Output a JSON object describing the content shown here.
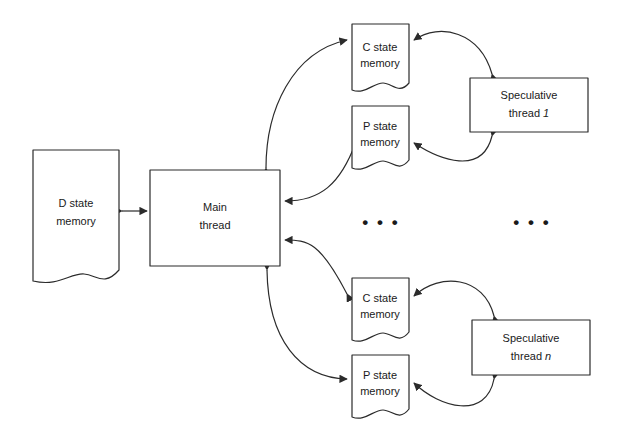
{
  "figure": {
    "type": "block-diagram",
    "background_color": "#ffffff",
    "line_color": "#2b2b2b",
    "text_color": "#1a1a1a"
  },
  "nodes": {
    "d_state_memory": {
      "line1": "D state",
      "line2": "memory",
      "shape": "document",
      "x": 33,
      "y": 150,
      "w": 86,
      "h": 135
    },
    "main_thread": {
      "line1": "Main",
      "line2": "thread",
      "shape": "rectangle",
      "x": 150,
      "y": 170,
      "w": 130,
      "h": 96
    },
    "c_state_memory_top": {
      "line1": "C state",
      "line2": "memory",
      "shape": "document",
      "x": 352,
      "y": 24,
      "w": 57,
      "h": 69
    },
    "p_state_memory_top": {
      "line1": "P state",
      "line2": "memory",
      "shape": "document",
      "x": 352,
      "y": 106,
      "w": 57,
      "h": 66
    },
    "speculative_thread_1": {
      "line1": "Speculative",
      "line2": "thread ",
      "line2_italic": "1",
      "shape": "rectangle",
      "x": 470,
      "y": 78,
      "w": 118,
      "h": 54
    },
    "c_state_memory_bottom": {
      "line1": "C state",
      "line2": "memory",
      "shape": "document",
      "x": 352,
      "y": 278,
      "w": 57,
      "h": 66
    },
    "p_state_memory_bottom": {
      "line1": "P state",
      "line2": "memory",
      "shape": "document",
      "x": 352,
      "y": 355,
      "w": 57,
      "h": 66
    },
    "speculative_thread_n": {
      "line1": "Speculative",
      "line2": "thread ",
      "line2_italic": "n",
      "shape": "rectangle",
      "x": 472,
      "y": 320,
      "w": 118,
      "h": 55
    }
  },
  "ellipses": {
    "middle_left": "• • •",
    "middle_right": "• • •"
  },
  "edges": [
    {
      "name": "d-state-to-main-thread",
      "from": "d_state_memory",
      "to": "main_thread",
      "style": "double-arrow"
    },
    {
      "name": "main-thread-to-c-state-top",
      "from": "main_thread",
      "to": "c_state_memory_top",
      "style": "curved-arrow"
    },
    {
      "name": "p-state-top-to-main-thread",
      "from": "p_state_memory_top",
      "to": "main_thread",
      "style": "curved-arrow"
    },
    {
      "name": "main-thread-to-p-state-top",
      "from": "main_thread",
      "to": "p_state_memory_top",
      "style": "curved-arrow"
    },
    {
      "name": "spec-thread-1-to-c-state-top",
      "from": "speculative_thread_1",
      "to": "c_state_memory_top",
      "style": "curved-arrow"
    },
    {
      "name": "spec-thread-1-to-p-state-top",
      "from": "speculative_thread_1",
      "to": "p_state_memory_top",
      "style": "curved-arrow"
    },
    {
      "name": "c-state-bottom-to-main-thread",
      "from": "c_state_memory_bottom",
      "to": "main_thread",
      "style": "curved-arrow"
    },
    {
      "name": "main-thread-to-p-state-bottom",
      "from": "main_thread",
      "to": "p_state_memory_bottom",
      "style": "curved-arrow"
    },
    {
      "name": "spec-thread-n-to-c-state-bottom",
      "from": "speculative_thread_n",
      "to": "c_state_memory_bottom",
      "style": "curved-arrow"
    },
    {
      "name": "spec-thread-n-to-p-state-bottom",
      "from": "speculative_thread_n",
      "to": "p_state_memory_bottom",
      "style": "curved-arrow"
    }
  ]
}
